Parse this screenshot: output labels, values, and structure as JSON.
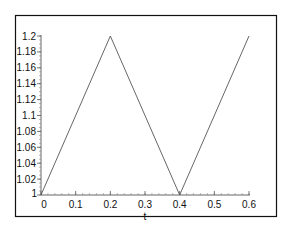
{
  "chart_data": {
    "type": "line",
    "title": "",
    "xlabel": "t",
    "ylabel": "",
    "xlim": [
      0,
      0.6
    ],
    "ylim": [
      1,
      1.2
    ],
    "grid": false,
    "legend": "none",
    "x_ticks": [
      "0",
      "0.1",
      "0.2",
      "0.3",
      "0.4",
      "0.5",
      "0.6"
    ],
    "x_tick_values": [
      0,
      0.1,
      0.2,
      0.3,
      0.4,
      0.5,
      0.6
    ],
    "y_ticks": [
      "1",
      "1.02",
      "1.04",
      "1.06",
      "1.08",
      "1.1",
      "1.12",
      "1.14",
      "1.16",
      "1.18",
      "1.2"
    ],
    "y_tick_values": [
      1,
      1.02,
      1.04,
      1.06,
      1.08,
      1.1,
      1.12,
      1.14,
      1.16,
      1.18,
      1.2
    ],
    "series": [
      {
        "name": "",
        "color": "#555555",
        "x": [
          0,
          0.2,
          0.4,
          0.6
        ],
        "y": [
          1,
          1.2,
          1,
          1.2
        ]
      }
    ]
  }
}
